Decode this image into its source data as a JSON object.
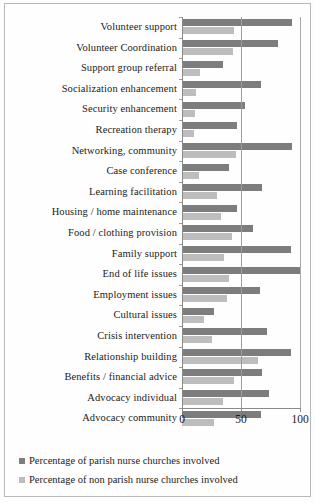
{
  "chart_data": {
    "type": "bar",
    "orientation": "horizontal",
    "title": "",
    "xlabel": "",
    "ylabel": "",
    "xlim": [
      0,
      100
    ],
    "xticks": [
      0,
      50,
      100
    ],
    "xtick_labels": [
      "0",
      "50",
      "100"
    ],
    "grid": true,
    "legend_position": "bottom-left",
    "categories": [
      "Volunteer support",
      "Volunteer Coordination",
      "Support group referral",
      "Socialization enhancement",
      "Security enhancement",
      "Recreation therapy",
      "Networking, community",
      "Case conference",
      "Learning facilitation",
      "Housing / home maintenance",
      "Food / clothing provision",
      "Family support",
      "End of life issues",
      "Employment issues",
      "Cultural  issues",
      "Crisis intervention",
      "Relationship building",
      "Benefits / financial advice",
      "Advocacy individual",
      "Advocacy community"
    ],
    "series": [
      {
        "name": "Percentage of parish nurse churches involved",
        "color": "#7d7d7d",
        "values": [
          93,
          81,
          35,
          67,
          53,
          47,
          93,
          40,
          68,
          47,
          60,
          92,
          100,
          66,
          27,
          72,
          92,
          68,
          74,
          67
        ]
      },
      {
        "name": "Percentage of non parish nurse churches involved",
        "color": "#bdbdbd",
        "values": [
          44,
          43,
          15,
          12,
          11,
          10,
          46,
          14,
          30,
          33,
          42,
          36,
          40,
          38,
          19,
          25,
          64,
          44,
          35,
          27
        ]
      }
    ]
  },
  "legend": {
    "items": [
      {
        "label": "Percentage of parish nurse churches involved",
        "color": "#7d7d7d",
        "marker": "square-marker"
      },
      {
        "label": "Percentage of non parish nurse churches involved",
        "color": "#bdbdbd",
        "marker": "square-marker"
      }
    ]
  }
}
